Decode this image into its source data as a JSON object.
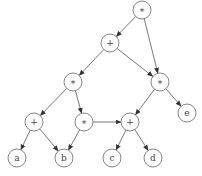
{
  "diagram": {
    "type": "expression-dag",
    "nodes": [
      {
        "id": "n1",
        "label": "*",
        "x": 142,
        "y": 10
      },
      {
        "id": "n2",
        "label": "+",
        "x": 110,
        "y": 43
      },
      {
        "id": "n3",
        "label": "*",
        "x": 73,
        "y": 82
      },
      {
        "id": "n4",
        "label": "*",
        "x": 160,
        "y": 82
      },
      {
        "id": "n5",
        "label": "+",
        "x": 34,
        "y": 122
      },
      {
        "id": "n6",
        "label": "*",
        "x": 84,
        "y": 122
      },
      {
        "id": "n7",
        "label": "+",
        "x": 130,
        "y": 122
      },
      {
        "id": "n8",
        "label": "e",
        "x": 187,
        "y": 113
      },
      {
        "id": "n9",
        "label": "a",
        "x": 17,
        "y": 158
      },
      {
        "id": "n10",
        "label": "b",
        "x": 64,
        "y": 158
      },
      {
        "id": "n11",
        "label": "c",
        "x": 112,
        "y": 158
      },
      {
        "id": "n12",
        "label": "d",
        "x": 153,
        "y": 158
      }
    ],
    "edges": [
      [
        "n1",
        "n2"
      ],
      [
        "n1",
        "n4"
      ],
      [
        "n2",
        "n3"
      ],
      [
        "n2",
        "n4"
      ],
      [
        "n3",
        "n5"
      ],
      [
        "n3",
        "n6"
      ],
      [
        "n4",
        "n7"
      ],
      [
        "n4",
        "n8"
      ],
      [
        "n5",
        "n9"
      ],
      [
        "n5",
        "n10"
      ],
      [
        "n6",
        "n10"
      ],
      [
        "n6",
        "n7"
      ],
      [
        "n7",
        "n11"
      ],
      [
        "n7",
        "n12"
      ]
    ],
    "node_radius": 9
  }
}
